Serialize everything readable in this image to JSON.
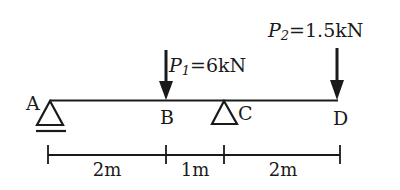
{
  "diagram": {
    "type": "beam-loading",
    "colors": {
      "ink": "#1a1a1a",
      "background": "#ffffff"
    },
    "points": [
      {
        "id": "A",
        "label": "A",
        "support": "pin"
      },
      {
        "id": "B",
        "label": "B",
        "support": "none"
      },
      {
        "id": "C",
        "label": "C",
        "support": "roller"
      },
      {
        "id": "D",
        "label": "D",
        "support": "none"
      }
    ],
    "loads": [
      {
        "name": "P1",
        "symbol": "P",
        "subscript": "1",
        "value_text": "=6kN",
        "at": "B",
        "value_kN": 6
      },
      {
        "name": "P2",
        "symbol": "P",
        "subscript": "2",
        "value_text": "=1.5kN",
        "at": "D",
        "value_kN": 1.5
      }
    ],
    "dimensions": [
      {
        "from": "A",
        "to": "B",
        "label": "2m"
      },
      {
        "from": "B",
        "to": "C",
        "label": "1m"
      },
      {
        "from": "C",
        "to": "D",
        "label": "2m"
      }
    ]
  }
}
